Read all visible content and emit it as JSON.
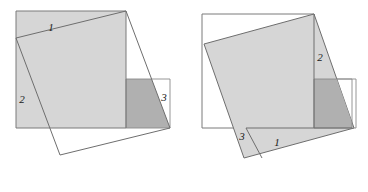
{
  "figure": {
    "colors": {
      "light_fill": "#d6d6d6",
      "dark_fill": "#b0b0b0",
      "outline": "#6e6e6e",
      "thin_outline": "#8a8a8a",
      "background": "#ffffff",
      "label_color": "#1a1a1a"
    },
    "panels": [
      {
        "name": "left-panel",
        "label": "left",
        "shapes": {
          "outer_square": {
            "name": "axis-aligned-square",
            "points": "16,11 126,11 126,128 16,128"
          },
          "tilted_square": {
            "name": "tilted-square-outline",
            "points": "126,11 170,128 60,155 16,38"
          },
          "light_region": {
            "name": "light-gray-region",
            "points": "16,11 126,11 126,128 16,128 16,38"
          },
          "dark_region": {
            "name": "dark-gray-square",
            "points": "126,79 170,79 170,128 126,128"
          },
          "dark_region_clip": {
            "name": "dark-region-clip",
            "points": "126,11 170,128 60,155 16,38"
          }
        },
        "labels": [
          {
            "name": "region-label-1",
            "text": "1",
            "x": 51,
            "y": 28
          },
          {
            "name": "region-label-2",
            "text": "2",
            "x": 22,
            "y": 100
          },
          {
            "name": "region-label-3",
            "text": "3",
            "x": 164,
            "y": 98
          }
        ]
      },
      {
        "name": "right-panel",
        "label": "right",
        "shapes": {
          "outer_square": {
            "name": "axis-aligned-square",
            "points": "202,14 314,14 314,128 202,128"
          },
          "tilted_square": {
            "name": "tilted-square-outline",
            "points": "314,14 354,128 244,158 204,44"
          },
          "thin_rect": {
            "name": "thin-outline-rectangle",
            "points": "314,79 356,79 356,128 314,128"
          },
          "big_light": {
            "name": "light-gray-tilted-square",
            "points": "314,14 354,128 244,158 204,44"
          },
          "dark_region": {
            "name": "dark-gray-square",
            "points": "314,79 352,79 352,128 314,128"
          },
          "piece_one": {
            "name": "piece-1-region",
            "points": "246,128 352,128 310,158 244,158"
          }
        },
        "labels": [
          {
            "name": "region-label-1",
            "text": "1",
            "x": 277,
            "y": 143
          },
          {
            "name": "region-label-2",
            "text": "2",
            "x": 320,
            "y": 58
          },
          {
            "name": "region-label-3",
            "text": "3",
            "x": 242,
            "y": 137
          }
        ]
      }
    ]
  }
}
